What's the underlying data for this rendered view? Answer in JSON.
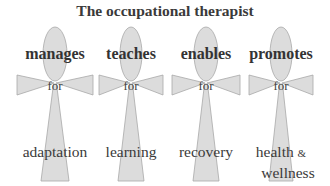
{
  "title": "The occupational therapist",
  "connector": "for",
  "figures": [
    {
      "verb": "manages",
      "outcome": "adaptation",
      "cx": 55
    },
    {
      "verb": "teaches",
      "outcome": "learning",
      "cx": 131
    },
    {
      "verb": "enables",
      "outcome": "recovery",
      "cx": 206
    },
    {
      "verb": "promotes",
      "outcome_line1": "health",
      "amp": "&",
      "outcome_line2": "wellness",
      "cx": 281
    }
  ],
  "colors": {
    "shape_fill": "#dcdcdc",
    "shape_stroke": "#a8a8a8",
    "text": "#3a3a3a"
  }
}
